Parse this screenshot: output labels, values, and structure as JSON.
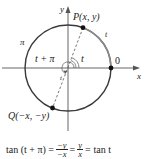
{
  "diagram": {
    "type": "unit-circle",
    "center": [
      68,
      68
    ],
    "radius": 43,
    "axes": {
      "x_label": "x",
      "y_label": "y"
    },
    "points": [
      {
        "id": "P",
        "label": "P(x, y)",
        "pos": [
          83,
          27
        ]
      },
      {
        "id": "Q",
        "label": "Q(−x, −y)",
        "pos": [
          52,
          108
        ]
      },
      {
        "id": "O",
        "label": "0",
        "pos": [
          111,
          68
        ]
      }
    ],
    "arc_labels": {
      "t_arc": "t",
      "pi_arc": "π"
    },
    "angle_labels": {
      "t": "t",
      "t_plus_pi": "t + π"
    },
    "colors": {
      "circle": "#3a3a3a",
      "t_arc": "#666666",
      "axis": "#555555",
      "dash": "#555555"
    }
  },
  "formula": {
    "lhs": "tan (t + π) =",
    "frac1_num": "−y",
    "frac1_den": "−x",
    "eq1": "=",
    "frac2_num": "y",
    "frac2_den": "x",
    "eq2": "=",
    "rhs": "tan t"
  }
}
